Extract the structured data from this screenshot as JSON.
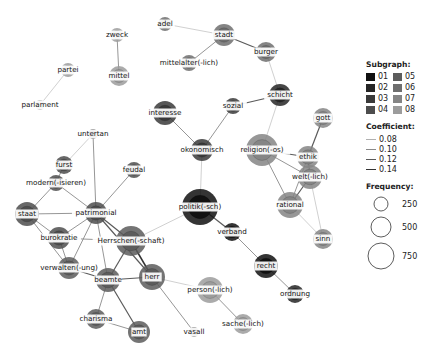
{
  "legend": {
    "subgraph_title": "Subgraph:",
    "subgraphs": [
      {
        "label": "01",
        "color": "#111111"
      },
      {
        "label": "02",
        "color": "#262626"
      },
      {
        "label": "03",
        "color": "#3a3a3a"
      },
      {
        "label": "04",
        "color": "#4d4d4d"
      },
      {
        "label": "05",
        "color": "#5c5c5c"
      },
      {
        "label": "06",
        "color": "#6e6e6e"
      },
      {
        "label": "07",
        "color": "#858585"
      },
      {
        "label": "08",
        "color": "#9c9c9c"
      }
    ],
    "coefficient_title": "Coefficient:",
    "coefficients": [
      {
        "label": "0.08",
        "width": 0.6,
        "color": "#b0b0b0"
      },
      {
        "label": "0.10",
        "width": 0.9,
        "color": "#8a8a8a"
      },
      {
        "label": "0.12",
        "width": 1.2,
        "color": "#5a5a5a"
      },
      {
        "label": "0.14",
        "width": 1.5,
        "color": "#333333"
      }
    ],
    "frequency_title": "Frequency:",
    "frequencies": [
      {
        "label": "250",
        "r": 7
      },
      {
        "label": "500",
        "r": 10
      },
      {
        "label": "750",
        "r": 13
      }
    ]
  },
  "graph": {
    "nodes": [
      {
        "id": "zweck",
        "label": "zweck",
        "x": 117,
        "y": 35,
        "r": 7,
        "sg": "08"
      },
      {
        "id": "mittel",
        "label": "mittel",
        "x": 119,
        "y": 76,
        "r": 10,
        "sg": "08"
      },
      {
        "id": "partei",
        "label": "partei",
        "x": 68,
        "y": 70,
        "r": 7,
        "sg": "08"
      },
      {
        "id": "parlament",
        "label": "parlament",
        "x": 40,
        "y": 105,
        "r": 5,
        "sg": "08"
      },
      {
        "id": "adel",
        "label": "adel",
        "x": 165,
        "y": 24,
        "r": 7,
        "sg": "06"
      },
      {
        "id": "stadt",
        "label": "stadt",
        "x": 224,
        "y": 35,
        "r": 11,
        "sg": "06"
      },
      {
        "id": "mittelalter",
        "label": "mittelalter(-lich)",
        "x": 189,
        "y": 63,
        "r": 8,
        "sg": "06"
      },
      {
        "id": "burger",
        "label": "burger",
        "x": 266,
        "y": 52,
        "r": 10,
        "sg": "06"
      },
      {
        "id": "schicht",
        "label": "schicht",
        "x": 280,
        "y": 95,
        "r": 11,
        "sg": "02"
      },
      {
        "id": "interesse",
        "label": "interesse",
        "x": 165,
        "y": 113,
        "r": 12,
        "sg": "03"
      },
      {
        "id": "sozial",
        "label": "sozial",
        "x": 233,
        "y": 106,
        "r": 8,
        "sg": "03"
      },
      {
        "id": "okonomisch",
        "label": "okonomisch",
        "x": 202,
        "y": 150,
        "r": 11,
        "sg": "03"
      },
      {
        "id": "gott",
        "label": "gott",
        "x": 323,
        "y": 118,
        "r": 10,
        "sg": "07"
      },
      {
        "id": "religion",
        "label": "religion(-os)",
        "x": 262,
        "y": 150,
        "r": 16,
        "sg": "07"
      },
      {
        "id": "ethik",
        "label": "ethik",
        "x": 308,
        "y": 157,
        "r": 11,
        "sg": "07"
      },
      {
        "id": "weltlich",
        "label": "welt(-lich)",
        "x": 310,
        "y": 177,
        "r": 12,
        "sg": "07"
      },
      {
        "id": "rational",
        "label": "rational",
        "x": 290,
        "y": 205,
        "r": 13,
        "sg": "07"
      },
      {
        "id": "sinn",
        "label": "sinn",
        "x": 323,
        "y": 239,
        "r": 10,
        "sg": "07"
      },
      {
        "id": "untertan",
        "label": "untertan",
        "x": 93,
        "y": 134,
        "r": 5,
        "sg": "04"
      },
      {
        "id": "furst",
        "label": "furst",
        "x": 64,
        "y": 165,
        "r": 9,
        "sg": "04"
      },
      {
        "id": "modern",
        "label": "modern(-isieren)",
        "x": 56,
        "y": 183,
        "r": 8,
        "sg": "04"
      },
      {
        "id": "feudal",
        "label": "feudal",
        "x": 134,
        "y": 170,
        "r": 8,
        "sg": "04"
      },
      {
        "id": "staat",
        "label": "staat",
        "x": 27,
        "y": 214,
        "r": 12,
        "sg": "04"
      },
      {
        "id": "patrimonial",
        "label": "patrimonial",
        "x": 96,
        "y": 213,
        "r": 11,
        "sg": "04"
      },
      {
        "id": "politik",
        "label": "politik(-sch)",
        "x": 200,
        "y": 207,
        "r": 18,
        "sg": "01"
      },
      {
        "id": "verband",
        "label": "verband",
        "x": 232,
        "y": 232,
        "r": 9,
        "sg": "01"
      },
      {
        "id": "burokratie",
        "label": "burokratie",
        "x": 59,
        "y": 238,
        "r": 11,
        "sg": "04"
      },
      {
        "id": "herrschen",
        "label": "Herrschen(-schaft)",
        "x": 131,
        "y": 241,
        "r": 15,
        "sg": "05"
      },
      {
        "id": "verwalten",
        "label": "verwalten(-ung)",
        "x": 69,
        "y": 268,
        "r": 11,
        "sg": "05"
      },
      {
        "id": "beamte",
        "label": "beamte",
        "x": 108,
        "y": 280,
        "r": 12,
        "sg": "05"
      },
      {
        "id": "herr",
        "label": "herr",
        "x": 152,
        "y": 277,
        "r": 13,
        "sg": "05"
      },
      {
        "id": "recht",
        "label": "recht",
        "x": 266,
        "y": 266,
        "r": 12,
        "sg": "01"
      },
      {
        "id": "ordnung",
        "label": "ordnung",
        "x": 295,
        "y": 294,
        "r": 9,
        "sg": "02"
      },
      {
        "id": "person",
        "label": "person(-lich)",
        "x": 210,
        "y": 290,
        "r": 13,
        "sg": "08"
      },
      {
        "id": "sache",
        "label": "sache(-lich)",
        "x": 243,
        "y": 324,
        "r": 10,
        "sg": "08"
      },
      {
        "id": "charisma",
        "label": "charisma",
        "x": 96,
        "y": 319,
        "r": 10,
        "sg": "05"
      },
      {
        "id": "amt",
        "label": "amt",
        "x": 139,
        "y": 332,
        "r": 11,
        "sg": "05"
      },
      {
        "id": "vasall",
        "label": "vasall",
        "x": 194,
        "y": 332,
        "r": 5,
        "sg": "05"
      }
    ],
    "edges": [
      [
        "zweck",
        "mittel",
        1
      ],
      [
        "partei",
        "parlament",
        0
      ],
      [
        "adel",
        "stadt",
        0
      ],
      [
        "stadt",
        "mittelalter",
        1
      ],
      [
        "stadt",
        "burger",
        2
      ],
      [
        "burger",
        "schicht",
        0
      ],
      [
        "schicht",
        "sozial",
        2
      ],
      [
        "schicht",
        "religion",
        0
      ],
      [
        "sozial",
        "okonomisch",
        1
      ],
      [
        "interesse",
        "okonomisch",
        1
      ],
      [
        "okonomisch",
        "politik",
        0
      ],
      [
        "gott",
        "ethik",
        2
      ],
      [
        "religion",
        "ethik",
        2
      ],
      [
        "religion",
        "weltlich",
        1
      ],
      [
        "religion",
        "rational",
        1
      ],
      [
        "ethik",
        "weltlich",
        2
      ],
      [
        "ethik",
        "rational",
        1
      ],
      [
        "weltlich",
        "rational",
        2
      ],
      [
        "weltlich",
        "sinn",
        0
      ],
      [
        "rational",
        "sinn",
        0
      ],
      [
        "untertan",
        "furst",
        0
      ],
      [
        "untertan",
        "patrimonial",
        1
      ],
      [
        "furst",
        "modern",
        1
      ],
      [
        "modern",
        "staat",
        1
      ],
      [
        "modern",
        "patrimonial",
        1
      ],
      [
        "feudal",
        "patrimonial",
        1
      ],
      [
        "staat",
        "patrimonial",
        1
      ],
      [
        "staat",
        "burokratie",
        1
      ],
      [
        "staat",
        "verwalten",
        1
      ],
      [
        "patrimonial",
        "burokratie",
        1
      ],
      [
        "patrimonial",
        "herrschen",
        2
      ],
      [
        "patrimonial",
        "verwalten",
        1
      ],
      [
        "patrimonial",
        "beamte",
        1
      ],
      [
        "patrimonial",
        "herr",
        2
      ],
      [
        "burokratie",
        "herrschen",
        1
      ],
      [
        "burokratie",
        "verwalten",
        1
      ],
      [
        "verwalten",
        "beamte",
        2
      ],
      [
        "herrschen",
        "beamte",
        2
      ],
      [
        "herrschen",
        "herr",
        3
      ],
      [
        "herrschen",
        "politik",
        0
      ],
      [
        "beamte",
        "herr",
        2
      ],
      [
        "beamte",
        "charisma",
        1
      ],
      [
        "beamte",
        "amt",
        2
      ],
      [
        "charisma",
        "amt",
        1
      ],
      [
        "herr",
        "vasall",
        1
      ],
      [
        "herr",
        "person",
        0
      ],
      [
        "politik",
        "verband",
        2
      ],
      [
        "verband",
        "recht",
        1
      ],
      [
        "recht",
        "ordnung",
        1
      ],
      [
        "person",
        "sache",
        1
      ]
    ]
  }
}
